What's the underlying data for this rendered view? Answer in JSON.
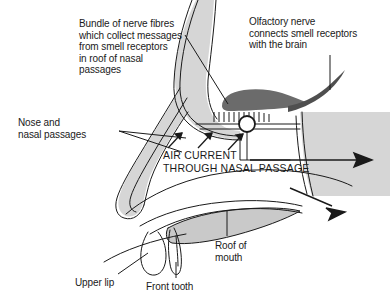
{
  "diagram": {
    "labels": {
      "nerve_bundle": "Bundle of nerve fibres\nwhich collect messages\nfrom smell receptors\nin roof of nasal\npassages",
      "olfactory_nerve": "Olfactory nerve\nconnects smell receptors\nwith the brain",
      "nose_nasal_passages": "Nose and\nnasal passages",
      "air_current": "AIR CURRENT\nTHROUGH NASAL PASSAGE",
      "roof_of_mouth": "Roof of\nmouth",
      "upper_lip": "Upper lip",
      "front_tooth": "Front tooth"
    },
    "parts": {
      "olfactory_bulb": "olfactory-bulb",
      "receptor_strip": "smell-receptor-strip",
      "nerve_junction": "nerve-junction-marker",
      "nasal_septum": "nasal-septum",
      "nasal_cavity": "nasal-cavity",
      "hard_palate": "hard-palate",
      "tongue": "tongue",
      "pharynx_wall": "pharynx-wall",
      "upper_lip_shape": "upper-lip",
      "front_tooth_shape": "front-tooth",
      "airflow_arrows": "airflow-arrows"
    },
    "colors": {
      "stroke": "#1a1a1a",
      "tissue_light": "#d6d6d6",
      "tissue_mid": "#c9c9c9",
      "bulb_dark": "#6b6b6b",
      "background": "#ffffff",
      "text": "#1a1a1a"
    }
  }
}
